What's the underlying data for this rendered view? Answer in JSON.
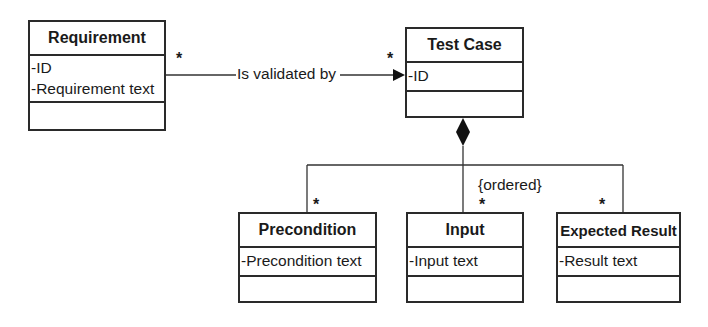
{
  "diagram": {
    "type": "UML class diagram",
    "classes": [
      {
        "id": "requirement",
        "name": "Requirement",
        "attributes": [
          "-ID",
          "-Requirement text"
        ],
        "operations": []
      },
      {
        "id": "test_case",
        "name": "Test Case",
        "attributes": [
          "-ID"
        ],
        "operations": []
      },
      {
        "id": "precondition",
        "name": "Precondition",
        "attributes": [
          "-Precondition text"
        ],
        "operations": []
      },
      {
        "id": "input",
        "name": "Input",
        "attributes": [
          "-Input text"
        ],
        "operations": []
      },
      {
        "id": "expected_result",
        "name": "Expected Result",
        "attributes": [
          "-Result text"
        ],
        "operations": []
      }
    ],
    "relationships": [
      {
        "type": "directed association",
        "from": "Requirement",
        "to": "Test Case",
        "label": "Is validated by",
        "from_multiplicity": "*",
        "to_multiplicity": "*"
      },
      {
        "type": "composition",
        "whole": "Test Case",
        "parts": [
          "Precondition",
          "Input",
          "Expected Result"
        ],
        "constraint": "{ordered}",
        "part_multiplicities": [
          "*",
          "*",
          "*"
        ]
      }
    ]
  },
  "labels": {
    "association": "Is validated by",
    "constraint": "{ordered}",
    "mult_req": "*",
    "mult_tc": "*",
    "mult_pre": "*",
    "mult_inp": "*",
    "mult_exp": "*"
  }
}
